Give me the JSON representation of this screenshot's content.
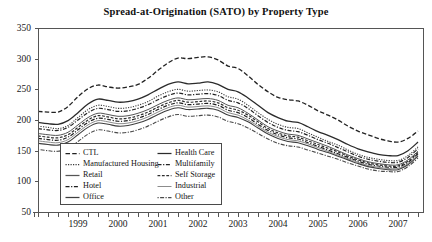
{
  "chart_data": {
    "type": "line",
    "title": "Spread-at-Origination (SATO) by Property Type",
    "xlabel": "",
    "ylabel": "",
    "ylim": [
      50,
      350
    ],
    "yticks": [
      50,
      100,
      150,
      200,
      250,
      300,
      350
    ],
    "xlim": [
      1998.25,
      2007.9
    ],
    "xticks": [
      1999,
      2000,
      2001,
      2002,
      2003,
      2004,
      2005,
      2006,
      2007
    ],
    "xtick_labels": [
      "1999",
      "2000",
      "2001",
      "2002",
      "2003",
      "2004",
      "2005",
      "2006",
      "2007"
    ],
    "minor_tick_interval": 0.25,
    "grid": false,
    "legend_position": "lower-left-inside",
    "x": [
      1998.25,
      1998.5,
      1998.75,
      1999.0,
      1999.25,
      1999.5,
      1999.75,
      2000.0,
      2000.25,
      2000.5,
      2000.75,
      2001.0,
      2001.25,
      2001.5,
      2001.75,
      2002.0,
      2002.25,
      2002.5,
      2002.75,
      2003.0,
      2003.25,
      2003.5,
      2003.75,
      2004.0,
      2004.25,
      2004.5,
      2004.75,
      2005.0,
      2005.25,
      2005.5,
      2005.75,
      2006.0,
      2006.25,
      2006.5,
      2006.75,
      2007.0,
      2007.25,
      2007.5,
      2007.75
    ],
    "series": [
      {
        "name": "CTL",
        "style": "dashed",
        "color": "#222222",
        "width": 1.3,
        "values": [
          214,
          213,
          213,
          222,
          238,
          251,
          257,
          254,
          252,
          254,
          258,
          268,
          281,
          293,
          301,
          300,
          302,
          303,
          298,
          288,
          284,
          272,
          258,
          246,
          237,
          233,
          231,
          224,
          215,
          208,
          200,
          190,
          182,
          176,
          170,
          166,
          164,
          170,
          182
        ]
      },
      {
        "name": "Health Care",
        "style": "solid",
        "color": "#2b2b2b",
        "width": 1.3,
        "values": [
          196,
          194,
          193,
          199,
          212,
          226,
          234,
          232,
          229,
          230,
          234,
          241,
          250,
          258,
          262,
          259,
          260,
          262,
          258,
          250,
          246,
          236,
          224,
          212,
          204,
          198,
          196,
          189,
          181,
          175,
          168,
          160,
          153,
          148,
          144,
          142,
          142,
          150,
          164
        ]
      },
      {
        "name": "Manufactured Housing",
        "style": "dotted",
        "color": "#3a3a3a",
        "width": 1.1,
        "values": [
          190,
          188,
          186,
          191,
          204,
          217,
          224,
          222,
          219,
          220,
          224,
          230,
          239,
          246,
          250,
          247,
          248,
          249,
          246,
          238,
          234,
          224,
          212,
          201,
          193,
          188,
          186,
          179,
          172,
          165,
          159,
          151,
          144,
          139,
          136,
          134,
          134,
          142,
          156
        ]
      },
      {
        "name": "Multifamily",
        "style": "dash-dot",
        "color": "#232323",
        "width": 1.2,
        "values": [
          186,
          184,
          183,
          188,
          200,
          212,
          219,
          217,
          214,
          215,
          219,
          225,
          233,
          240,
          244,
          241,
          242,
          243,
          240,
          232,
          228,
          219,
          207,
          196,
          188,
          183,
          181,
          175,
          168,
          162,
          155,
          148,
          141,
          136,
          133,
          131,
          131,
          139,
          153
        ]
      },
      {
        "name": "Retail",
        "style": "solid",
        "color": "#555555",
        "width": 1.0,
        "values": [
          178,
          176,
          175,
          180,
          192,
          204,
          211,
          209,
          206,
          207,
          211,
          217,
          225,
          232,
          236,
          233,
          234,
          235,
          232,
          224,
          220,
          211,
          200,
          189,
          182,
          177,
          175,
          169,
          163,
          157,
          150,
          143,
          137,
          132,
          129,
          127,
          127,
          135,
          149
        ]
      },
      {
        "name": "Self Storage",
        "style": "dashed-short",
        "color": "#2e2e2e",
        "width": 1.2,
        "values": [
          174,
          172,
          171,
          176,
          188,
          200,
          207,
          205,
          202,
          203,
          207,
          213,
          221,
          228,
          232,
          229,
          230,
          231,
          228,
          220,
          216,
          208,
          197,
          186,
          179,
          174,
          172,
          166,
          160,
          154,
          148,
          141,
          135,
          130,
          127,
          125,
          125,
          133,
          147
        ]
      },
      {
        "name": "Hotel",
        "style": "dash-dot",
        "color": "#1e1e1e",
        "width": 1.2,
        "values": [
          170,
          168,
          167,
          172,
          184,
          196,
          203,
          201,
          198,
          199,
          203,
          209,
          217,
          224,
          228,
          225,
          226,
          227,
          224,
          216,
          212,
          204,
          193,
          183,
          176,
          171,
          169,
          163,
          157,
          151,
          145,
          139,
          133,
          128,
          125,
          123,
          123,
          131,
          145
        ]
      },
      {
        "name": "Industrial",
        "style": "solid-light",
        "color": "#8c8c8c",
        "width": 1.0,
        "values": [
          166,
          164,
          163,
          168,
          180,
          192,
          199,
          197,
          194,
          195,
          199,
          205,
          213,
          220,
          224,
          221,
          222,
          223,
          220,
          212,
          208,
          200,
          190,
          180,
          173,
          168,
          166,
          161,
          155,
          149,
          143,
          137,
          131,
          126,
          123,
          121,
          121,
          129,
          143
        ]
      },
      {
        "name": "Office",
        "style": "solid",
        "color": "#3f3f3f",
        "width": 1.1,
        "values": [
          162,
          160,
          159,
          164,
          176,
          188,
          195,
          193,
          190,
          191,
          195,
          201,
          209,
          216,
          220,
          217,
          218,
          219,
          216,
          208,
          204,
          197,
          187,
          177,
          170,
          165,
          163,
          158,
          152,
          147,
          141,
          135,
          129,
          124,
          121,
          119,
          119,
          127,
          141
        ]
      },
      {
        "name": "Other",
        "style": "dash-dot-fine",
        "color": "#4a4a4a",
        "width": 1.1,
        "values": [
          152,
          150,
          149,
          154,
          165,
          177,
          184,
          182,
          179,
          180,
          184,
          190,
          198,
          205,
          209,
          206,
          207,
          208,
          205,
          198,
          194,
          187,
          178,
          169,
          162,
          158,
          156,
          151,
          146,
          141,
          136,
          130,
          125,
          120,
          117,
          116,
          116,
          124,
          138
        ]
      }
    ]
  },
  "legend": {
    "left_column": [
      {
        "label": "CTL",
        "style": "dashed",
        "color": "#222222"
      },
      {
        "label": "Manufactured Housing",
        "style": "dotted",
        "color": "#3a3a3a"
      },
      {
        "label": "Retail",
        "style": "solid",
        "color": "#555555"
      },
      {
        "label": "Hotel",
        "style": "dash-dot",
        "color": "#1e1e1e"
      },
      {
        "label": "Office",
        "style": "solid",
        "color": "#3f3f3f"
      }
    ],
    "right_column": [
      {
        "label": "Health Care",
        "style": "solid",
        "color": "#2b2b2b"
      },
      {
        "label": "Multifamily",
        "style": "dash-dot",
        "color": "#232323"
      },
      {
        "label": "Self Storage",
        "style": "dashed-short",
        "color": "#2e2e2e"
      },
      {
        "label": "Industrial",
        "style": "solid-light",
        "color": "#8c8c8c"
      },
      {
        "label": "Other",
        "style": "dash-dot-fine",
        "color": "#4a4a4a"
      }
    ]
  },
  "axis": {
    "color": "#555555"
  }
}
